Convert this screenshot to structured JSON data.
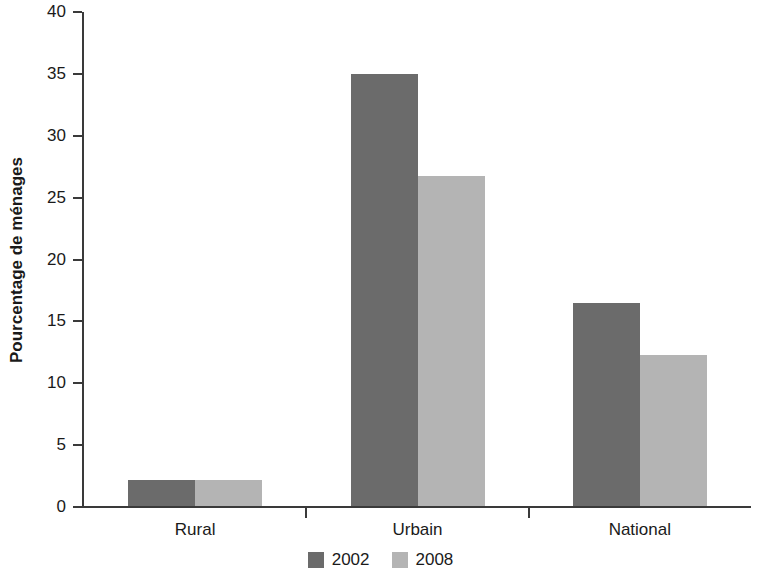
{
  "chart_data": {
    "type": "bar",
    "title": "",
    "xlabel": "",
    "ylabel": "Pourcentage de ménages",
    "categories": [
      "Rural",
      "Urbain",
      "National"
    ],
    "series": [
      {
        "name": "2002",
        "color": "#6b6b6b",
        "values": [
          2.1,
          34.9,
          16.4
        ]
      },
      {
        "name": "2008",
        "color": "#b4b4b4",
        "values": [
          2.1,
          26.7,
          12.2
        ]
      }
    ],
    "ylim": [
      0,
      40
    ],
    "yticks": [
      0,
      5,
      10,
      15,
      20,
      25,
      30,
      35,
      40
    ],
    "ytick_labels": [
      "0",
      "5",
      "10",
      "15",
      "20",
      "25",
      "30",
      "35",
      "40"
    ],
    "grid": false,
    "legend_position": "bottom-center",
    "axis_color": "#3a3a3a",
    "background": "#ffffff"
  }
}
